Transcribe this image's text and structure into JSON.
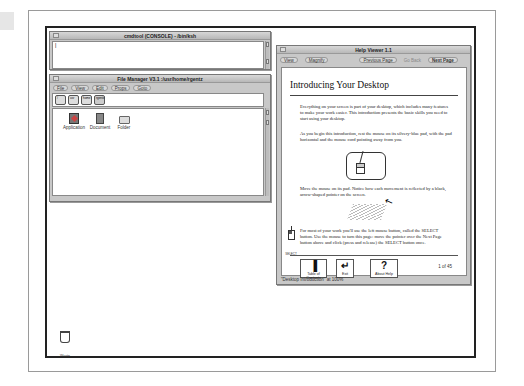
{
  "console": {
    "title": "cmdtool (CONSOLE) - /bin/ksh",
    "prompt": "|"
  },
  "file_manager": {
    "title": "File Manager V3.1  :/usr/home/rgentz",
    "menus": [
      "File",
      "View",
      "Edit",
      "Props",
      "Goto"
    ],
    "path_icons": [
      "/",
      "usr",
      "home",
      "rgentz"
    ],
    "items": [
      {
        "label": "Application",
        "icon": "application-icon"
      },
      {
        "label": "Document",
        "icon": "document-icon"
      },
      {
        "label": "Folder",
        "icon": "folder-icon"
      }
    ]
  },
  "help_viewer": {
    "title": "Help Viewer 1.1",
    "menus": {
      "view": "View",
      "magnify": "Magnify"
    },
    "nav": {
      "previous": "Previous Page",
      "go_back": "Go Back",
      "next": "Next Page"
    },
    "heading": "Introducing Your Desktop",
    "paragraphs": [
      "Everything on your screen is part of your desktop, which includes many features to make your work easier. This introduction presents the basic skills you need to start using your desktop.",
      "As you begin this introduction, rest the mouse on its silvery-blue pad, with the pad horizontal and the mouse cord pointing away from you.",
      "Move the mouse on its pad. Notice how each movement is reflected by a black, arrow-shaped pointer on the screen.",
      "For most of your work you'll use the left mouse button, called the SELECT button. Use the mouse to turn this page: move the pointer over the Next Page button above and click (press and release) the SELECT button once."
    ],
    "select_label": "SELECT",
    "buttons": {
      "toc": "Table of Contents",
      "exit": "Exit",
      "about": "About Help"
    },
    "page_count": "1 of 45",
    "status": "\"Desktop Introduction\" at 100%"
  },
  "desktop": {
    "wastebasket_label": "Waste"
  }
}
